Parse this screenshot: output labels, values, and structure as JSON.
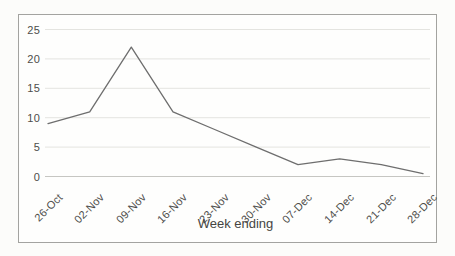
{
  "chart_data": {
    "type": "line",
    "title": "",
    "xlabel": "Week ending",
    "ylabel": "",
    "categories": [
      "26-Oct",
      "02-Nov",
      "09-Nov",
      "16-Nov",
      "23-Nov",
      "30-Nov",
      "07-Dec",
      "14-Dec",
      "21-Dec",
      "28-Dec"
    ],
    "values": [
      9,
      11,
      22,
      11,
      8,
      5,
      2,
      3,
      2,
      0.5
    ],
    "ylim": [
      0,
      25
    ],
    "yticks": [
      0,
      5,
      10,
      15,
      20,
      25
    ],
    "grid": true,
    "legend": false,
    "x_tick_rotation_deg": 45,
    "colors": {
      "line": "#6e6e6e",
      "gridline": "#e4e4e0",
      "zero_axis": "#c6c6c2",
      "frame_border": "#a3a3a0",
      "text": "#4d4d4a",
      "background": "#fcfcfa"
    }
  }
}
